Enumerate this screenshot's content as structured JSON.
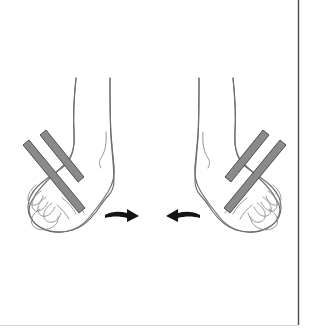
{
  "figure": {
    "title": "Ankle inversion with resistance bands",
    "background_color": "#ffffff",
    "width": 309,
    "height": 328,
    "style": "black-and-white line drawing"
  },
  "colors": {
    "ink": "#6e6e72",
    "ink_light": "#8b8b90",
    "band_fill": "#8a8a8a",
    "band_outline": "#4f4f4f",
    "arrow": "#141414",
    "frame_line": "#4a4a4a",
    "background": "#ffffff"
  },
  "elements": {
    "left_limb": {
      "name": "left leg and foot",
      "description": "Lower leg, ankle and foot of the left limb, toes pointing to the lower left"
    },
    "right_limb": {
      "name": "right leg and foot",
      "description": "Lower leg, ankle and foot of the right limb, toes pointing to the lower right"
    },
    "left_bands": {
      "name": "resistance bands on left forefoot",
      "count": 2,
      "direction": "upper-left to lower-right"
    },
    "right_bands": {
      "name": "resistance bands on right forefoot",
      "count": 2,
      "direction": "upper-right to lower-left"
    },
    "left_arrow": {
      "name": "motion arrow pointing right",
      "direction": "right",
      "meaning": "left foot moves inward"
    },
    "right_arrow": {
      "name": "motion arrow pointing left",
      "direction": "left",
      "meaning": "right foot moves inward"
    },
    "frame": {
      "name": "page border rule",
      "description": "Thin dark vertical rule near the right edge and a faint horizontal rule along the bottom"
    }
  }
}
